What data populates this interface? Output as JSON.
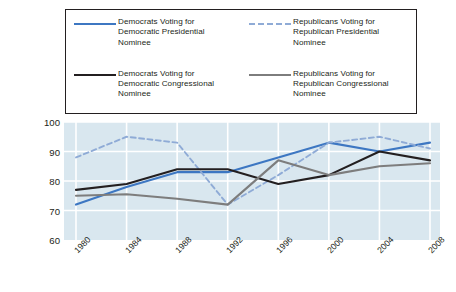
{
  "legend": {
    "items": [
      {
        "label": "Democrats Voting for Democratic Presidential Nominee",
        "style": "solid",
        "color": "#3d77c2",
        "swatch_name": "legend-swatch-dem-presidential"
      },
      {
        "label": "Republicans Voting for Republican Presidential Nominee",
        "style": "dashed",
        "color": "#8fabd6",
        "swatch_name": "legend-swatch-rep-presidential"
      },
      {
        "label": "Democrats Voting for Democratic Congressional Nominee",
        "style": "solid",
        "color": "#231f20",
        "swatch_name": "legend-swatch-dem-congressional"
      },
      {
        "label": "Republicans Voting for Republican Congressional Nominee",
        "style": "solid",
        "color": "#7d7d7d",
        "swatch_name": "legend-swatch-rep-congressional"
      }
    ]
  },
  "axis": {
    "ylabel": "Percent",
    "yticks": [
      "100",
      "90",
      "80",
      "70",
      "60"
    ],
    "xticks": [
      "1980",
      "1984",
      "1988",
      "1992",
      "1996",
      "2000",
      "2004",
      "2008"
    ]
  },
  "colors": {
    "plot_background": "#d9e7ef",
    "gridline": "#ffffff",
    "dem_presidential": "#3d77c2",
    "rep_presidential": "#8fabd6",
    "dem_congressional": "#231f20",
    "rep_congressional": "#7d7d7d",
    "text": "#231f20"
  },
  "chart_data": {
    "type": "line",
    "title": "",
    "xlabel": "",
    "ylabel": "Percent",
    "categories": [
      "1980",
      "1984",
      "1988",
      "1992",
      "1996",
      "2000",
      "2004",
      "2008"
    ],
    "x": [
      1980,
      1984,
      1988,
      1992,
      1996,
      2000,
      2004,
      2008
    ],
    "ylim": [
      60,
      100
    ],
    "yticks": [
      60,
      70,
      80,
      90,
      100
    ],
    "grid": true,
    "legend_position": "top",
    "series": [
      {
        "name": "Democrats Voting for Democratic Presidential Nominee",
        "color": "#3d77c2",
        "style": "solid",
        "values": [
          72,
          78,
          83,
          83,
          88,
          93,
          90,
          93
        ]
      },
      {
        "name": "Republicans Voting for Republican Presidential Nominee",
        "color": "#8fabd6",
        "style": "dashed",
        "values": [
          88,
          95,
          93,
          72,
          82,
          93,
          95,
          91
        ]
      },
      {
        "name": "Democrats Voting for Democratic Congressional Nominee",
        "color": "#231f20",
        "style": "solid",
        "values": [
          77,
          79,
          84,
          84,
          79,
          82,
          90,
          87
        ]
      },
      {
        "name": "Republicans Voting for Republican Congressional Nominee",
        "color": "#7d7d7d",
        "style": "solid",
        "values": [
          75,
          75.5,
          74,
          72,
          87,
          82,
          85,
          86
        ]
      }
    ]
  }
}
